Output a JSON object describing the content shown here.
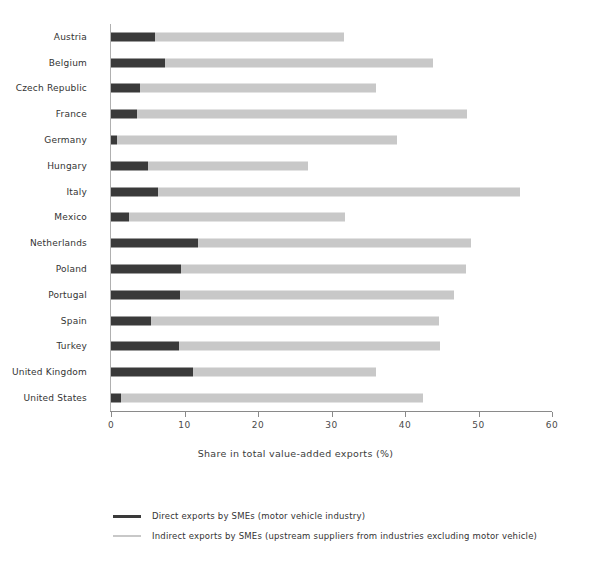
{
  "chart_data": {
    "type": "bar",
    "orientation": "horizontal",
    "stacked": true,
    "title": "",
    "xlabel": "Share in total value-added exports (%)",
    "ylabel": "",
    "xlim": [
      0,
      60
    ],
    "xticks": [
      0,
      10,
      20,
      30,
      40,
      50,
      60
    ],
    "xtick_labels": [
      "0",
      "10",
      "20",
      "30",
      "40",
      "50",
      "60"
    ],
    "grid": false,
    "legend_position": "bottom-left",
    "categories": [
      "Austria",
      "Belgium",
      "Czech Republic",
      "France",
      "Germany",
      "Hungary",
      "Italy",
      "Mexico",
      "Netherlands",
      "Poland",
      "Portugal",
      "Spain",
      "Turkey",
      "United Kingdom",
      "United States"
    ],
    "series": [
      {
        "name": "Direct exports by SMEs (motor vehicle industry)",
        "color": "#3a3a3a",
        "values": [
          6.0,
          7.3,
          3.9,
          3.5,
          0.8,
          5.1,
          6.4,
          2.4,
          11.8,
          9.5,
          9.4,
          5.4,
          9.2,
          11.2,
          1.4
        ]
      },
      {
        "name": "Indirect exports by SMEs (upstream suppliers from industries excluding motor vehicle)",
        "color": "#c8c8c8",
        "values": [
          25.7,
          36.5,
          32.1,
          44.9,
          38.1,
          21.7,
          49.2,
          29.4,
          37.2,
          38.8,
          37.3,
          39.2,
          35.6,
          24.8,
          41.0
        ]
      }
    ],
    "totals": [
      31.7,
      43.8,
      36.0,
      48.4,
      38.9,
      26.8,
      55.6,
      31.8,
      49.0,
      48.3,
      46.7,
      44.6,
      44.8,
      36.0,
      42.4
    ]
  },
  "legend": {
    "items": [
      {
        "label": "Direct exports by SMEs (motor vehicle industry)",
        "color": "#3a3a3a"
      },
      {
        "label": "Indirect exports by SMEs (upstream suppliers from industries excluding motor vehicle)",
        "color": "#c8c8c8"
      }
    ]
  }
}
